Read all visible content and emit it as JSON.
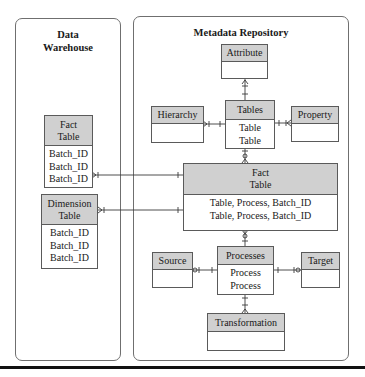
{
  "panels": {
    "data_warehouse": {
      "title_line1": "Data",
      "title_line2": "Warehouse"
    },
    "metadata_repository": {
      "title": "Metadata Repository"
    }
  },
  "entities": {
    "dw_fact_table": {
      "header_line1": "Fact",
      "header_line2": "Table",
      "rows": [
        "Batch_ID",
        "Batch_ID",
        "Batch_ID"
      ]
    },
    "dw_dimension_table": {
      "header_line1": "Dimension",
      "header_line2": "Table",
      "rows": [
        "Batch_ID",
        "Batch_ID",
        "Batch_ID"
      ]
    },
    "attribute": {
      "header": "Attribute",
      "rows": []
    },
    "hierarchy": {
      "header": "Hierarchy",
      "rows": []
    },
    "tables": {
      "header": "Tables",
      "rows": [
        "Table",
        "Table"
      ]
    },
    "property": {
      "header": "Property",
      "rows": []
    },
    "md_fact_table": {
      "header_line1": "Fact",
      "header_line2": "Table",
      "rows": [
        "Table, Process, Batch_ID",
        "Table, Process, Batch_ID"
      ]
    },
    "source": {
      "header": "Source",
      "rows": []
    },
    "processes": {
      "header": "Processes",
      "rows": [
        "Process",
        "Process"
      ]
    },
    "target": {
      "header": "Target",
      "rows": []
    },
    "transformation": {
      "header": "Transformation",
      "rows": []
    }
  },
  "relationships": [
    {
      "from": "attribute",
      "to": "tables",
      "notation": "one-to-many (crow's foot)"
    },
    {
      "from": "hierarchy",
      "to": "tables",
      "notation": "many-to-one"
    },
    {
      "from": "property",
      "to": "tables",
      "notation": "many-to-one"
    },
    {
      "from": "tables",
      "to": "md_fact_table",
      "notation": "zero-or-many"
    },
    {
      "from": "dw_fact_table",
      "to": "md_fact_table",
      "notation": "many-to-one"
    },
    {
      "from": "dw_dimension_table",
      "to": "md_fact_table",
      "notation": "many-to-one"
    },
    {
      "from": "md_fact_table",
      "to": "processes",
      "notation": "zero-or-many"
    },
    {
      "from": "source",
      "to": "processes",
      "notation": "zero-or-many"
    },
    {
      "from": "target",
      "to": "processes",
      "notation": "zero-or-many"
    },
    {
      "from": "transformation",
      "to": "processes",
      "notation": "many-to-one"
    }
  ],
  "colors": {
    "header_fill": "#d0d0d0",
    "border": "#5a5a5a",
    "panel_border": "#6f6f6f",
    "rule": "#111111"
  }
}
